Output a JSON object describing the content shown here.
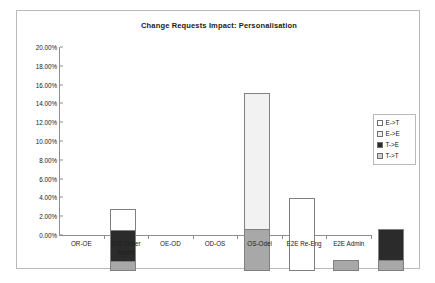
{
  "chart_data": {
    "type": "bar",
    "subtype": "stacked-column",
    "title": "Change Requests Impact: Personalisation",
    "xlabel": "",
    "ylabel": "",
    "ylim": [
      0,
      0.2
    ],
    "grid": false,
    "legend_position": "right",
    "categories": [
      "OR-OE",
      "E2E Order Mgmt",
      "OE-OD",
      "OD-OS",
      "OS-Odel",
      "E2E Re-Eng",
      "E2E Admin"
    ],
    "category_lines": [
      [
        "OR-OE"
      ],
      [
        "E2E Order",
        "Mgmt"
      ],
      [
        "OE-OD"
      ],
      [
        "OD-OS"
      ],
      [
        "OS-Odel"
      ],
      [
        "E2E Re-Eng"
      ],
      [
        "E2E Admin"
      ]
    ],
    "ytick_labels": [
      "0.00%",
      "2.00%",
      "4.00%",
      "6.00%",
      "8.00%",
      "10.00%",
      "12.00%",
      "14.00%",
      "16.00%",
      "18.00%",
      "20.00%"
    ],
    "ytick_values": [
      0,
      2,
      4,
      6,
      8,
      10,
      12,
      14,
      16,
      18,
      20
    ],
    "series": [
      {
        "name": "T->T",
        "color": "#a8a8a8",
        "values": [
          1.1,
          0,
          0,
          4.5,
          0,
          1.2,
          1.2
        ]
      },
      {
        "name": "T->E",
        "color": "#2b2b2b",
        "values": [
          3.3,
          0,
          0,
          0,
          0,
          0,
          3.3
        ]
      },
      {
        "name": "E->E",
        "color": "#f2f2f2",
        "values": [
          0,
          0,
          0,
          14.4,
          0,
          0,
          0
        ]
      },
      {
        "name": "E->T",
        "color": "#ffffff",
        "values": [
          2.2,
          0,
          0,
          0,
          7.8,
          0,
          0
        ]
      }
    ],
    "totals": [
      6.6,
      0,
      0,
      18.9,
      7.8,
      1.2,
      4.5
    ]
  },
  "legend": {
    "items": [
      {
        "label": "E->T",
        "color": "#ffffff"
      },
      {
        "label": "E->E",
        "color": "#f2f2f2"
      },
      {
        "label": "T->E",
        "color": "#2b2b2b"
      },
      {
        "label": "T->T",
        "color": "#d0d0d0"
      }
    ]
  },
  "colors": {
    "frame_border": "#b9b9b9",
    "axis": "#8d8d8d",
    "text": "#202020",
    "plot_background": "#ffffff"
  }
}
